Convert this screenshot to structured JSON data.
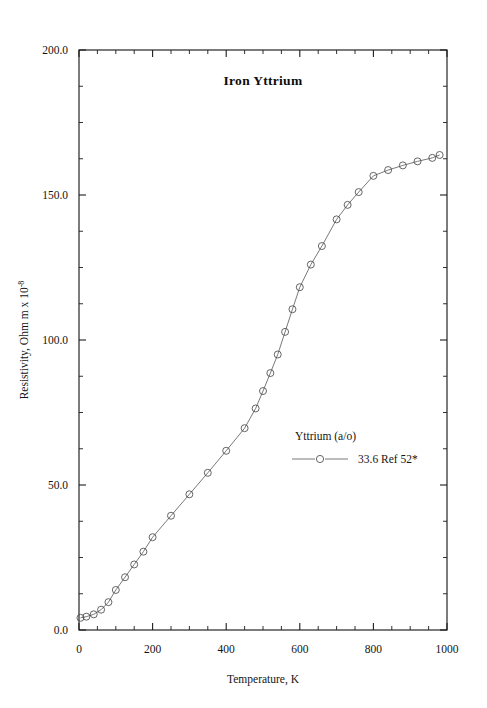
{
  "figure": {
    "background_color": "#ffffff",
    "frame_color": "#1c1c1c",
    "series_color": "#6a6a6a",
    "marker_color": "#4a4a4a"
  },
  "chart_data": {
    "type": "line",
    "title": "Iron  Yttrium",
    "xlabel": "Temperature,  K",
    "ylabel": "Resistivity, Ohm m x 10",
    "ylabel_exponent": "-8",
    "xlim": [
      0,
      1000
    ],
    "ylim": [
      0,
      200
    ],
    "grid": false,
    "x_major_ticks": [
      0,
      200,
      400,
      600,
      800,
      1000
    ],
    "x_major_tick_labels": [
      "0",
      "200",
      "400",
      "600",
      "800",
      "1000"
    ],
    "x_minor_interval": 50,
    "y_major_ticks": [
      0,
      50,
      100,
      150,
      200
    ],
    "y_major_tick_labels": [
      "0.0",
      "50.0",
      "100.0",
      "150.0",
      "200.0"
    ],
    "y_minor_interval": 12.5,
    "legend": {
      "position": "center-right-inside",
      "header": "Yttrium (a/o)",
      "entries": [
        {
          "label": "33.6 Ref 52*",
          "marker": "open-circle",
          "line": "solid"
        }
      ]
    },
    "series": [
      {
        "name": "33.6 Ref 52*",
        "marker": "open-circle",
        "x": [
          4,
          20,
          40,
          60,
          80,
          100,
          125,
          150,
          175,
          200,
          250,
          300,
          350,
          400,
          450,
          480,
          500,
          520,
          540,
          560,
          580,
          600,
          630,
          660,
          700,
          730,
          760,
          800,
          840,
          880,
          920,
          960,
          980
        ],
        "y": [
          4.2,
          4.6,
          5.4,
          7.0,
          9.6,
          13.8,
          18.2,
          22.6,
          27.0,
          32.0,
          39.4,
          46.8,
          54.2,
          61.8,
          69.6,
          76.4,
          82.4,
          88.6,
          95.0,
          102.8,
          110.6,
          118.2,
          126.0,
          132.4,
          141.6,
          146.6,
          151.0,
          156.6,
          158.6,
          160.2,
          161.6,
          162.8,
          163.8
        ]
      }
    ]
  }
}
